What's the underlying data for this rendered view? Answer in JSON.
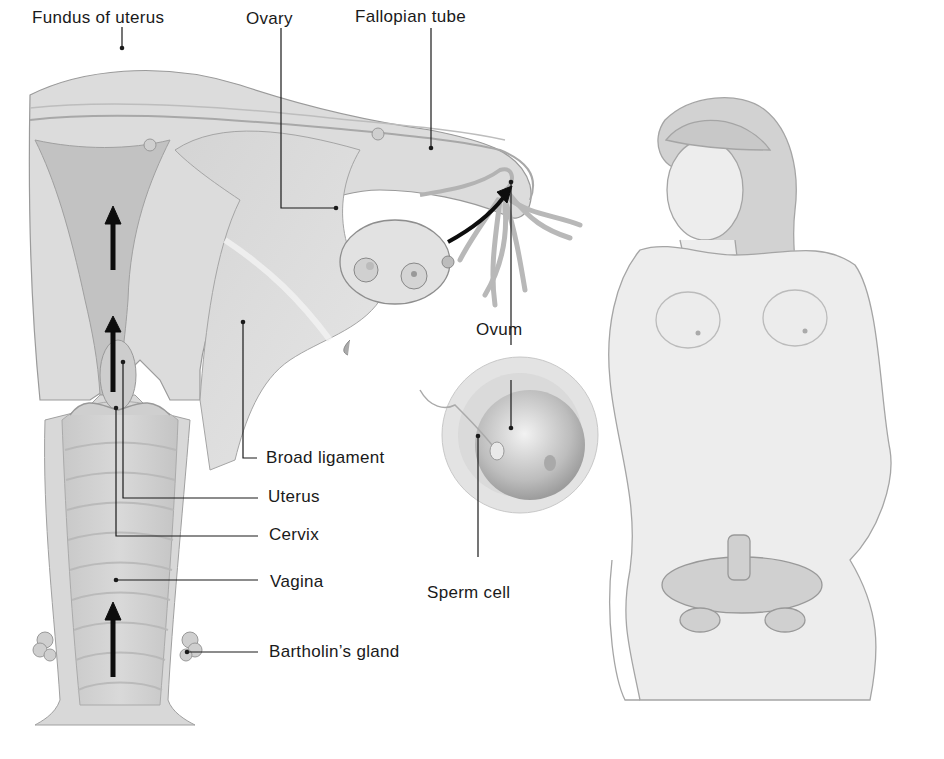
{
  "diagram": {
    "labels": {
      "fundus": "Fundus of uterus",
      "ovary": "Ovary",
      "fallopian_tube": "Fallopian tube",
      "ovum": "Ovum",
      "broad_ligament": "Broad ligament",
      "uterus": "Uterus",
      "cervix": "Cervix",
      "vagina": "Vagina",
      "sperm_cell": "Sperm cell",
      "bartholins_gland": "Bartholin’s gland"
    },
    "colors": {
      "tissue_light": "#e4e4e4",
      "tissue_mid": "#cfcfcf",
      "tissue_dark": "#b5b5b5",
      "outline": "#9a9a9a",
      "leader_line": "#1a1a1a",
      "arrow": "#0d0d0d",
      "background": "#ffffff"
    }
  }
}
